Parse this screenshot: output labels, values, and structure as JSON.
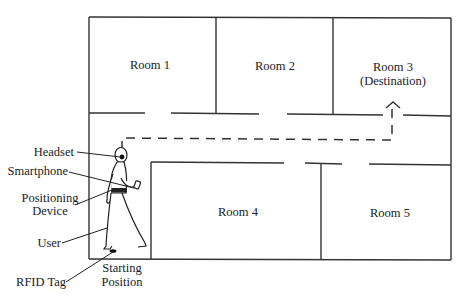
{
  "diagram": {
    "type": "indoor-navigation-floor-plan",
    "rooms": [
      {
        "id": "room1",
        "label": "Room 1"
      },
      {
        "id": "room2",
        "label": "Room 2"
      },
      {
        "id": "room3",
        "label": "Room 3",
        "sublabel": "(Destination)"
      },
      {
        "id": "room4",
        "label": "Room 4"
      },
      {
        "id": "room5",
        "label": "Room 5"
      }
    ],
    "callouts": {
      "headset": "Headset",
      "smartphone": "Smartphone",
      "positioning_line1": "Positioning",
      "positioning_line2": "Device",
      "user": "User",
      "rfid": "RFID Tag",
      "start_line1": "Starting",
      "start_line2": "Position"
    },
    "colors": {
      "line": "#333333",
      "background": "#ffffff"
    }
  }
}
